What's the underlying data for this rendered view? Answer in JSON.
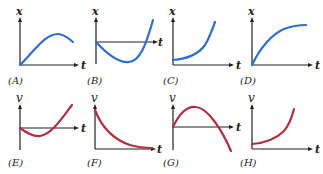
{
  "colors": {
    "position_curve": "#2f6fc9",
    "velocity_curve": "#b03040",
    "axis": "#231f20"
  },
  "panels": [
    {
      "id": "A",
      "label": "(A)",
      "y_axis": "x",
      "x_axis": "t"
    },
    {
      "id": "B",
      "label": "(B)",
      "y_axis": "x",
      "x_axis": "t"
    },
    {
      "id": "C",
      "label": "(C)",
      "y_axis": "x",
      "x_axis": "t"
    },
    {
      "id": "D",
      "label": "(D)",
      "y_axis": "x",
      "x_axis": "t"
    },
    {
      "id": "E",
      "label": "(E)",
      "y_axis": "v",
      "x_axis": "t"
    },
    {
      "id": "F",
      "label": "(F)",
      "y_axis": "v",
      "x_axis": "t"
    },
    {
      "id": "G",
      "label": "(G)",
      "y_axis": "v",
      "x_axis": "t"
    },
    {
      "id": "H",
      "label": "(H)",
      "y_axis": "v",
      "x_axis": "t"
    }
  ]
}
